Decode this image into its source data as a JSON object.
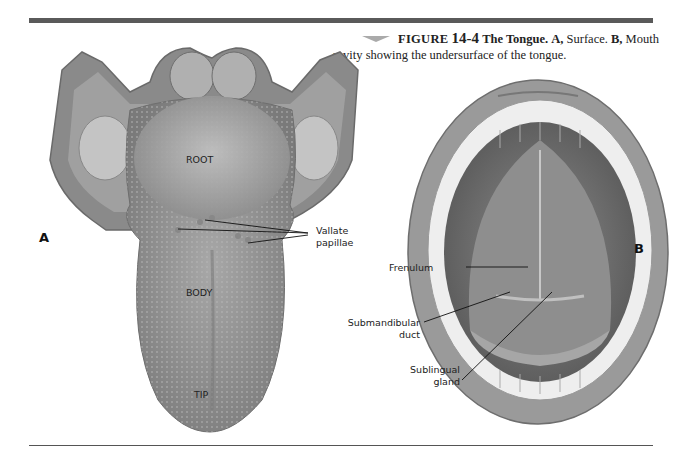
{
  "caption": {
    "figure_label": "FIGURE",
    "figure_number": "14-4",
    "title": "The Tongue.",
    "part_a_label": "A,",
    "part_a_text": "Surface.",
    "part_b_label": "B,",
    "part_b_text": "Mouth cavity showing the undersurface of the tongue."
  },
  "panels": {
    "a": "A",
    "b": "B"
  },
  "tongue_labels": {
    "root": "ROOT",
    "body": "BODY",
    "tip": "TIP",
    "vallate_1": "Vallate",
    "vallate_2": "papillae"
  },
  "mouth_labels": {
    "frenulum": "Frenulum",
    "submandibular_1": "Submandibular",
    "submandibular_2": "duct",
    "sublingual_1": "Sublingual",
    "sublingual_2": "gland"
  },
  "colors": {
    "rule": "#5a5a5a",
    "tissue_dark": "#6e6e6e",
    "tissue_mid": "#9a9a9a",
    "tissue_light": "#c4c4c4",
    "teeth": "#eeeeee"
  }
}
